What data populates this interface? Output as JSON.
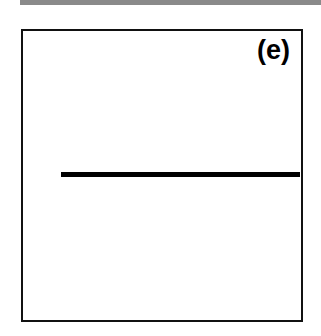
{
  "figure": {
    "panel_label": "(e)",
    "background_color": "#ffffff",
    "border_color": "#111111",
    "top_rule_color": "#8a8a8a"
  },
  "chart_data": {
    "type": "line",
    "title": "(e)",
    "xlabel": "",
    "ylabel": "",
    "xlim": [
      0,
      1
    ],
    "ylim": [
      0,
      1
    ],
    "grid": false,
    "legend": null,
    "axis_ticks": {
      "x": [],
      "y": []
    },
    "annotations": [
      {
        "text": "(e)",
        "position": "top-right"
      }
    ],
    "series": [
      {
        "name": "flat-response",
        "color": "#000000",
        "linewidth": 5,
        "x": [
          0.06,
          0.99
        ],
        "y": [
          0.52,
          0.52
        ]
      }
    ]
  }
}
